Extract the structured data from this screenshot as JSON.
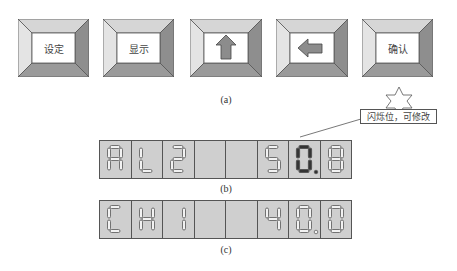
{
  "buttons": [
    {
      "id": "set",
      "label": "设定",
      "icon": null,
      "x": 18
    },
    {
      "id": "display",
      "label": "显示",
      "icon": null,
      "x": 103
    },
    {
      "id": "up",
      "label": "",
      "icon": "arrow-up-icon",
      "x": 190
    },
    {
      "id": "left",
      "label": "",
      "icon": "arrow-left-icon",
      "x": 276
    },
    {
      "id": "confirm",
      "label": "确认",
      "icon": null,
      "x": 362
    }
  ],
  "captions": {
    "a": "(a)",
    "b": "(b)",
    "c": "(c)"
  },
  "callout": {
    "text": "闪烁位，可修改",
    "icon": "star-icon"
  },
  "displays": {
    "b": {
      "digits": [
        "A",
        "L",
        "2",
        "",
        "",
        "S",
        "0",
        "8"
      ],
      "decimal_point_after_index": 6,
      "flashing_index": 6
    },
    "c": {
      "digits": [
        "C",
        "H",
        "1",
        "",
        "",
        "4",
        "0",
        "0"
      ],
      "decimal_point_after_index": 6,
      "flashing_index": null
    }
  },
  "colors": {
    "bezel_top": "#d6d6d6",
    "bezel_left": "#e4e4e4",
    "bezel_right": "#8e8e8e",
    "bezel_bottom": "#9a9a9a",
    "face": "#ffffff",
    "panel": "#cfcfcf",
    "segment_unlit": "#f2f2f2",
    "segment_lit": "#333333",
    "arrow": "#8c8c8c"
  }
}
